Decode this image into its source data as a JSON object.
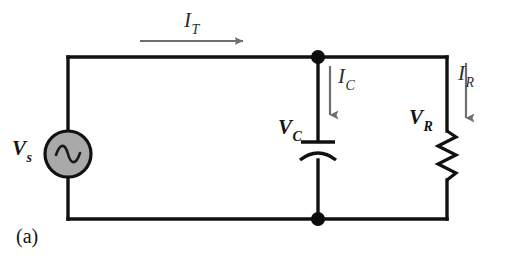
{
  "figure": {
    "caption": "(a)",
    "type": "parallel-rc-circuit-schematic",
    "background_color": "#ffffff",
    "wire_color": "#111111",
    "arrow_color": "#6e6e6e",
    "source_fill_color": "#a9a9a9"
  },
  "labels": {
    "source_voltage": {
      "symbol": "V",
      "subscript": "s"
    },
    "capacitor_voltage": {
      "symbol": "V",
      "subscript": "C"
    },
    "resistor_voltage": {
      "symbol": "V",
      "subscript": "R"
    },
    "total_current": {
      "symbol": "I",
      "subscript": "T"
    },
    "capacitor_current": {
      "symbol": "I",
      "subscript": "C"
    },
    "resistor_current": {
      "symbol": "I",
      "subscript": "R"
    }
  },
  "components": {
    "ac_source": {
      "name": "ac-voltage-source",
      "symbol": "sine-wave"
    },
    "capacitor": {
      "name": "capacitor",
      "symbol": "polarized-capacitor"
    },
    "resistor": {
      "name": "resistor",
      "symbol": "zigzag"
    },
    "nodes": [
      {
        "name": "top-junction-node"
      },
      {
        "name": "bottom-junction-node"
      }
    ]
  }
}
